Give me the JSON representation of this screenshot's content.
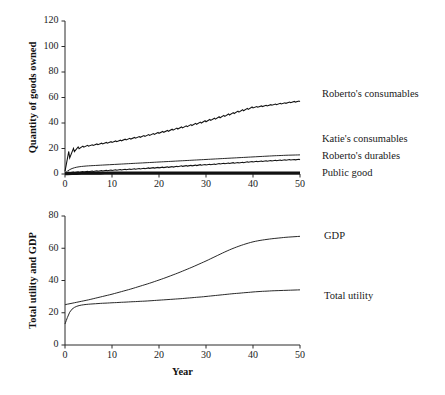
{
  "figure": {
    "background": "#ffffff",
    "line_color": "#111111",
    "axis_color": "#2b2b2b"
  },
  "panels": [
    {
      "id": "top",
      "ylabel": "Quantity of goods owned",
      "xlabel": "",
      "xticks": [
        "0",
        "10",
        "20",
        "30",
        "40",
        "50"
      ],
      "yticks": [
        "0",
        "20",
        "40",
        "60",
        "80",
        "100",
        "120"
      ],
      "labels": [
        {
          "name": "robertos-consumables",
          "text": "Roberto's consumables",
          "x": 322,
          "y": 89
        },
        {
          "name": "katies-consumables",
          "text": "Katie's consumables",
          "x": 322,
          "y": 134
        },
        {
          "name": "robertos-durables",
          "text": "Roberto's durables",
          "x": 322,
          "y": 151
        },
        {
          "name": "public-good",
          "text": "Public good",
          "x": 322,
          "y": 168
        }
      ]
    },
    {
      "id": "bottom",
      "ylabel": "Total utility and GDP",
      "xlabel": "Year",
      "xticks": [
        "0",
        "10",
        "20",
        "30",
        "40",
        "50"
      ],
      "yticks": [
        "0",
        "20",
        "40",
        "60",
        "80"
      ],
      "labels": [
        {
          "name": "gdp",
          "text": "GDP",
          "x": 324,
          "y": 231
        },
        {
          "name": "total-utility",
          "text": "Total utility",
          "x": 324,
          "y": 291
        }
      ]
    }
  ],
  "chart_data": [
    {
      "type": "line",
      "panel": "top",
      "title": "",
      "xlabel": "",
      "ylabel": "Quantity of goods owned",
      "xlim": [
        0,
        50
      ],
      "ylim": [
        0,
        120
      ],
      "xticks": [
        0,
        10,
        20,
        30,
        40,
        50
      ],
      "yticks": [
        0,
        20,
        40,
        60,
        80,
        100,
        120
      ],
      "grid": false,
      "legend": "right-side inline labels",
      "x": [
        0,
        1,
        2,
        3,
        4,
        5,
        6,
        7,
        8,
        9,
        10,
        11,
        12,
        13,
        14,
        15,
        16,
        17,
        18,
        19,
        20,
        21,
        22,
        23,
        24,
        25,
        26,
        27,
        28,
        29,
        30,
        31,
        32,
        33,
        34,
        35,
        36,
        37,
        38,
        39,
        40,
        41,
        42,
        43,
        44,
        45,
        46,
        47,
        48,
        49,
        50
      ],
      "series": [
        {
          "name": "Roberto's consumables",
          "style": "sawtooth",
          "values": [
            2.0,
            12.5,
            17.5,
            19.8,
            21.0,
            21.8,
            22.4,
            23.0,
            23.6,
            24.2,
            24.8,
            25.4,
            26.0,
            26.7,
            27.4,
            28.1,
            28.8,
            29.5,
            30.3,
            31.1,
            31.9,
            32.7,
            33.5,
            34.4,
            35.3,
            36.2,
            37.1,
            38.0,
            39.0,
            40.0,
            41.0,
            42.0,
            43.0,
            44.1,
            45.2,
            46.3,
            47.4,
            48.5,
            49.6,
            50.7,
            51.8,
            52.4,
            52.9,
            53.4,
            53.9,
            54.4,
            54.9,
            55.4,
            55.9,
            56.4,
            56.8
          ]
        },
        {
          "name": "Katie's consumables",
          "style": "smooth",
          "values": [
            0.8,
            3.6,
            5.0,
            5.7,
            6.1,
            6.4,
            6.6,
            6.8,
            7.0,
            7.2,
            7.4,
            7.6,
            7.8,
            8.0,
            8.2,
            8.4,
            8.6,
            8.8,
            9.0,
            9.2,
            9.4,
            9.6,
            9.8,
            10.0,
            10.2,
            10.4,
            10.6,
            10.8,
            11.0,
            11.2,
            11.4,
            11.6,
            11.8,
            12.0,
            12.2,
            12.4,
            12.6,
            12.8,
            13.0,
            13.2,
            13.4,
            13.6,
            13.8,
            14.0,
            14.2,
            14.4,
            14.5,
            14.7,
            14.8,
            14.9,
            15.0
          ]
        },
        {
          "name": "Roberto's durables",
          "style": "sawtooth",
          "values": [
            0.3,
            0.9,
            1.2,
            1.4,
            1.6,
            1.8,
            2.0,
            2.2,
            2.4,
            2.6,
            2.8,
            3.0,
            3.2,
            3.4,
            3.6,
            3.8,
            4.0,
            4.2,
            4.4,
            4.6,
            4.8,
            5.0,
            5.2,
            5.4,
            5.7,
            6.0,
            6.2,
            6.4,
            6.6,
            6.9,
            7.1,
            7.3,
            7.5,
            7.8,
            8.0,
            8.2,
            8.5,
            8.7,
            8.9,
            9.2,
            9.4,
            9.6,
            9.8,
            10.0,
            10.2,
            10.4,
            10.6,
            10.8,
            11.0,
            11.1,
            11.2
          ]
        },
        {
          "name": "Public good",
          "style": "thick-flat",
          "values": [
            0.2,
            0.4,
            0.5,
            0.6,
            0.6,
            0.7,
            0.7,
            0.7,
            0.8,
            0.8,
            0.8,
            0.8,
            0.8,
            0.8,
            0.8,
            0.8,
            0.8,
            0.8,
            0.8,
            0.8,
            0.8,
            0.8,
            0.8,
            0.8,
            0.8,
            0.8,
            0.8,
            0.8,
            0.8,
            0.8,
            0.8,
            0.8,
            0.8,
            0.8,
            0.8,
            0.8,
            0.8,
            0.8,
            0.8,
            0.8,
            0.8,
            0.8,
            0.8,
            0.8,
            0.8,
            0.8,
            0.8,
            0.8,
            0.8,
            0.8,
            0.8
          ]
        }
      ]
    },
    {
      "type": "line",
      "panel": "bottom",
      "title": "",
      "xlabel": "Year",
      "ylabel": "Total utility and GDP",
      "xlim": [
        0,
        50
      ],
      "ylim": [
        0,
        80
      ],
      "xticks": [
        0,
        10,
        20,
        30,
        40,
        50
      ],
      "yticks": [
        0,
        20,
        40,
        60,
        80
      ],
      "grid": false,
      "legend": "right-side inline labels",
      "x": [
        0,
        1,
        2,
        3,
        4,
        5,
        6,
        7,
        8,
        9,
        10,
        11,
        12,
        13,
        14,
        15,
        16,
        17,
        18,
        19,
        20,
        21,
        22,
        23,
        24,
        25,
        26,
        27,
        28,
        29,
        30,
        31,
        32,
        33,
        34,
        35,
        36,
        37,
        38,
        39,
        40,
        41,
        42,
        43,
        44,
        45,
        46,
        47,
        48,
        49,
        50
      ],
      "series": [
        {
          "name": "GDP",
          "style": "smooth",
          "values": [
            25.0,
            25.6,
            26.2,
            26.8,
            27.4,
            28.0,
            28.7,
            29.4,
            30.1,
            30.8,
            31.5,
            32.3,
            33.1,
            33.9,
            34.7,
            35.6,
            36.5,
            37.4,
            38.3,
            39.3,
            40.3,
            41.3,
            42.4,
            43.5,
            44.6,
            45.8,
            47.0,
            48.2,
            49.5,
            50.8,
            52.1,
            53.5,
            54.9,
            56.3,
            57.7,
            59.0,
            60.2,
            61.3,
            62.3,
            63.2,
            64.0,
            64.6,
            65.1,
            65.5,
            65.9,
            66.2,
            66.5,
            66.8,
            67.0,
            67.2,
            67.4
          ]
        },
        {
          "name": "Total utility",
          "style": "smooth",
          "values": [
            13.0,
            21.0,
            23.5,
            24.5,
            25.0,
            25.3,
            25.5,
            25.7,
            25.9,
            26.0,
            26.2,
            26.3,
            26.5,
            26.6,
            26.8,
            26.9,
            27.1,
            27.2,
            27.4,
            27.6,
            27.8,
            28.0,
            28.2,
            28.4,
            28.6,
            28.8,
            29.1,
            29.3,
            29.6,
            29.8,
            30.1,
            30.4,
            30.7,
            31.0,
            31.3,
            31.6,
            31.9,
            32.1,
            32.4,
            32.6,
            32.9,
            33.1,
            33.3,
            33.4,
            33.6,
            33.7,
            33.8,
            33.9,
            34.0,
            34.1,
            34.2
          ]
        }
      ]
    }
  ]
}
